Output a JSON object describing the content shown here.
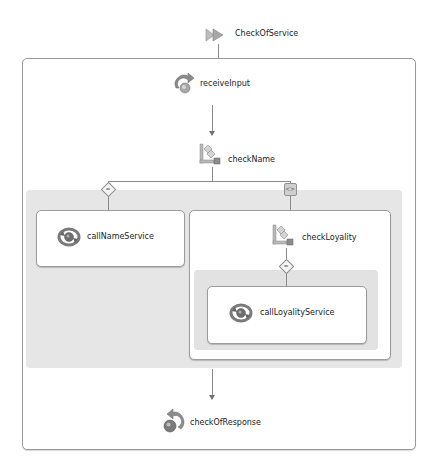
{
  "process": {
    "name": "CheckOfService",
    "start_icon": "process-flag-icon"
  },
  "activities": {
    "receive": {
      "label": "receiveInput",
      "icon": "receive-icon"
    },
    "switch_name": {
      "label": "checkName",
      "icon": "switch-icon"
    },
    "invoke_name": {
      "label": "callNameService",
      "icon": "invoke-icon"
    },
    "switch_loyalty": {
      "label": "checkLoyality",
      "icon": "switch-icon"
    },
    "invoke_loyalty": {
      "label": "callLoyalityService",
      "icon": "invoke-icon"
    },
    "reply": {
      "label": "checkOfResponse",
      "icon": "reply-icon"
    }
  },
  "branches": {
    "case_name": {
      "glyph": "="
    },
    "otherwise_name": {
      "glyph": "<>"
    },
    "case_loyalty": {
      "glyph": "="
    }
  },
  "colors": {
    "border": "#9a9a9a",
    "branch_area": "#e6e6e6",
    "icon_gray": "#7d7d7d",
    "icon_dark": "#555555"
  }
}
